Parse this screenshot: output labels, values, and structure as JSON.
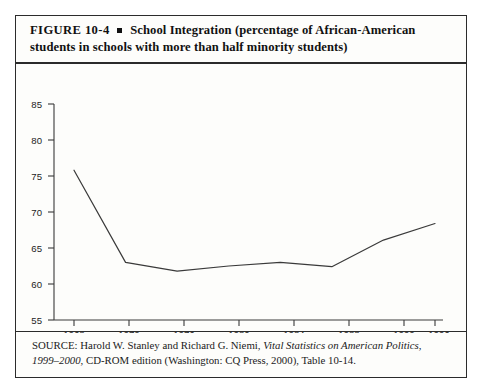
{
  "figure": {
    "label": "FIGURE  10-4",
    "bullet": "square-bullet",
    "title_line_1": "School Integration (percentage of African-American",
    "title_line_2": "students in schools with more than half minority students)"
  },
  "source": {
    "prefix": "SOURCE: Harold W. Stanley and Richard G. Niemi,",
    "work_italic": "Vital Statistics on American Politics,",
    "years_italic": "1999–2000,",
    "suffix": " CD-ROM edition (Washington: CQ Press, 2000), Table 10-14."
  },
  "chart_data": {
    "type": "line",
    "title": "School Integration (percentage of African-American students in schools with more than half minority students)",
    "xlabel": "",
    "ylabel": "",
    "x": [
      1968,
      1972,
      1976,
      1980,
      1984,
      1988,
      1992,
      1996
    ],
    "categories": [
      "1968",
      "1972",
      "1976",
      "1980",
      "1984",
      "1988",
      "1992",
      "1996"
    ],
    "values": [
      75.8,
      63.0,
      61.8,
      62.5,
      63.0,
      62.4,
      66.1,
      68.4
    ],
    "series": [
      {
        "name": "Percentage of African-American students in majority-minority schools",
        "values": [
          75.8,
          63.0,
          61.8,
          62.5,
          63.0,
          62.4,
          66.1,
          68.4
        ]
      }
    ],
    "xlim": [
      1968,
      1996
    ],
    "ylim": [
      55,
      85
    ],
    "ytick_labels": [
      "85",
      "80",
      "75",
      "70",
      "65",
      "60",
      "55"
    ],
    "yticks": [
      85,
      80,
      75,
      70,
      65,
      60,
      55
    ],
    "xtick_labels": [
      "1968",
      "1972",
      "1976",
      "1980",
      "1984",
      "1988",
      "1992",
      "1996"
    ],
    "grid": false,
    "legend": false,
    "line_color": "#3a3a3a"
  }
}
